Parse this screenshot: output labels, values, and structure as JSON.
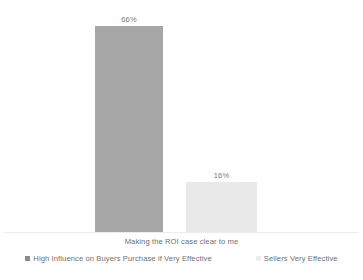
{
  "chart_data": {
    "type": "bar",
    "title": "",
    "subtitle": "",
    "xlabel": "",
    "ylabel": "",
    "categories": [
      "Making the ROI case clear to me"
    ],
    "series": [
      {
        "name": "High Influence on Buyers Purchase if Very Effective",
        "values": [
          66
        ],
        "data_labels": [
          "66%"
        ],
        "color": "#a6a6a6",
        "legend_marker": "square-icon"
      },
      {
        "name": "Sellers Very Effective",
        "values": [
          16
        ],
        "data_labels": [
          "16%"
        ],
        "color": "#e9e9e9",
        "legend_marker": "square-icon"
      }
    ],
    "ylim": [
      0,
      70
    ],
    "grid": false,
    "axis_line": true,
    "legend_position": "bottom",
    "value_unit": "%"
  },
  "axis": {
    "category_label": "Making the ROI case clear to me"
  },
  "labels": {
    "bar_1_value": "66%",
    "bar_2_value": "16%"
  },
  "legend": {
    "items": [
      {
        "label": "High Influence on Buyers Purchase if Very Effective",
        "color": "#8c8c8c"
      },
      {
        "label": "Sellers Very Effective",
        "color": "#ededed"
      }
    ]
  },
  "colors": {
    "background": "#ffffff",
    "bar_primary": "#a6a6a6",
    "bar_secondary": "#e9e9e9",
    "text": "#6f6f6f",
    "axis_line": "#ededed"
  }
}
